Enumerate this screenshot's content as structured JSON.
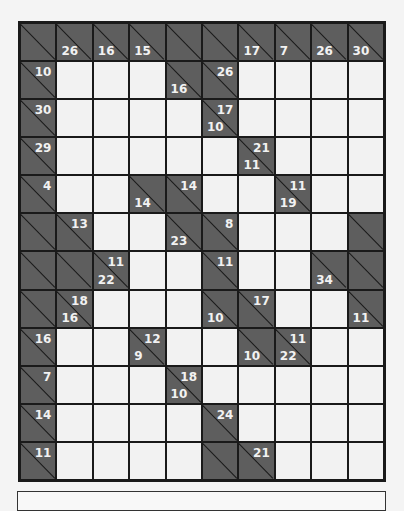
{
  "puzzle": {
    "type": "kakuro",
    "cols": 10,
    "rows": 12,
    "colors": {
      "clue_bg": "#5e5e5e",
      "white_bg": "#f2f2f2",
      "grid_line": "#1a1a1a",
      "clue_text": "#f2f2f2"
    },
    "cells": [
      [
        {
          "t": "B"
        },
        {
          "t": "C",
          "d": "26"
        },
        {
          "t": "C",
          "d": "16"
        },
        {
          "t": "C",
          "d": "15"
        },
        {
          "t": "B"
        },
        {
          "t": "B"
        },
        {
          "t": "C",
          "d": "17"
        },
        {
          "t": "C",
          "d": "7"
        },
        {
          "t": "C",
          "d": "26"
        },
        {
          "t": "C",
          "d": "30"
        }
      ],
      [
        {
          "t": "C",
          "r": "10"
        },
        {
          "t": "W"
        },
        {
          "t": "W"
        },
        {
          "t": "W"
        },
        {
          "t": "C",
          "d": "16"
        },
        {
          "t": "C",
          "r": "26"
        },
        {
          "t": "W"
        },
        {
          "t": "W"
        },
        {
          "t": "W"
        },
        {
          "t": "W"
        }
      ],
      [
        {
          "t": "C",
          "r": "30"
        },
        {
          "t": "W"
        },
        {
          "t": "W"
        },
        {
          "t": "W"
        },
        {
          "t": "W"
        },
        {
          "t": "C",
          "d": "10",
          "r": "17"
        },
        {
          "t": "W"
        },
        {
          "t": "W"
        },
        {
          "t": "W"
        },
        {
          "t": "W"
        }
      ],
      [
        {
          "t": "C",
          "r": "29"
        },
        {
          "t": "W"
        },
        {
          "t": "W"
        },
        {
          "t": "W"
        },
        {
          "t": "W"
        },
        {
          "t": "W"
        },
        {
          "t": "C",
          "d": "11",
          "r": "21"
        },
        {
          "t": "W"
        },
        {
          "t": "W"
        },
        {
          "t": "W"
        }
      ],
      [
        {
          "t": "C",
          "r": "4"
        },
        {
          "t": "W"
        },
        {
          "t": "W"
        },
        {
          "t": "C",
          "d": "14"
        },
        {
          "t": "C",
          "r": "14"
        },
        {
          "t": "W"
        },
        {
          "t": "W"
        },
        {
          "t": "C",
          "d": "19",
          "r": "11"
        },
        {
          "t": "W"
        },
        {
          "t": "W"
        }
      ],
      [
        {
          "t": "B"
        },
        {
          "t": "C",
          "r": "13"
        },
        {
          "t": "W"
        },
        {
          "t": "W"
        },
        {
          "t": "C",
          "d": "23"
        },
        {
          "t": "C",
          "r": "8"
        },
        {
          "t": "W"
        },
        {
          "t": "W"
        },
        {
          "t": "W"
        },
        {
          "t": "B"
        }
      ],
      [
        {
          "t": "B"
        },
        {
          "t": "B"
        },
        {
          "t": "C",
          "d": "22",
          "r": "11"
        },
        {
          "t": "W"
        },
        {
          "t": "W"
        },
        {
          "t": "C",
          "r": "11"
        },
        {
          "t": "W"
        },
        {
          "t": "W"
        },
        {
          "t": "C",
          "d": "34"
        },
        {
          "t": "B"
        }
      ],
      [
        {
          "t": "B"
        },
        {
          "t": "C",
          "d": "16",
          "r": "18"
        },
        {
          "t": "W"
        },
        {
          "t": "W"
        },
        {
          "t": "W"
        },
        {
          "t": "C",
          "d": "10"
        },
        {
          "t": "C",
          "r": "17"
        },
        {
          "t": "W"
        },
        {
          "t": "W"
        },
        {
          "t": "C",
          "d": "11"
        }
      ],
      [
        {
          "t": "C",
          "r": "16"
        },
        {
          "t": "W"
        },
        {
          "t": "W"
        },
        {
          "t": "C",
          "d": "9",
          "r": "12"
        },
        {
          "t": "W"
        },
        {
          "t": "W"
        },
        {
          "t": "C",
          "d": "10"
        },
        {
          "t": "C",
          "d": "22",
          "r": "11"
        },
        {
          "t": "W"
        },
        {
          "t": "W"
        }
      ],
      [
        {
          "t": "C",
          "r": "7"
        },
        {
          "t": "W"
        },
        {
          "t": "W"
        },
        {
          "t": "W"
        },
        {
          "t": "C",
          "d": "10",
          "r": "18"
        },
        {
          "t": "W"
        },
        {
          "t": "W"
        },
        {
          "t": "W"
        },
        {
          "t": "W"
        },
        {
          "t": "W"
        }
      ],
      [
        {
          "t": "C",
          "r": "14"
        },
        {
          "t": "W"
        },
        {
          "t": "W"
        },
        {
          "t": "W"
        },
        {
          "t": "W"
        },
        {
          "t": "C",
          "r": "24"
        },
        {
          "t": "W"
        },
        {
          "t": "W"
        },
        {
          "t": "W"
        },
        {
          "t": "W"
        }
      ],
      [
        {
          "t": "C",
          "r": "11"
        },
        {
          "t": "W"
        },
        {
          "t": "W"
        },
        {
          "t": "W"
        },
        {
          "t": "W"
        },
        {
          "t": "B"
        },
        {
          "t": "C",
          "r": "21"
        },
        {
          "t": "W"
        },
        {
          "t": "W"
        },
        {
          "t": "W"
        }
      ]
    ]
  },
  "footer": {
    "text": ""
  }
}
